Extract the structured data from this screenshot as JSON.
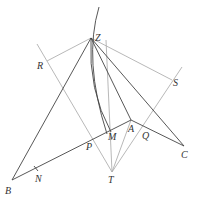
{
  "diagram": {
    "type": "geometry-construction",
    "colors": {
      "background": "#ffffff",
      "primary_line": "#444444",
      "construction_line": "#b0b0b0",
      "label": "#333333"
    },
    "points": {
      "Z": {
        "label": "Z",
        "x": 91,
        "y": 38,
        "lx": 95,
        "ly": 40
      },
      "R": {
        "label": "R",
        "x": 47,
        "y": 60,
        "lx": 37,
        "ly": 69
      },
      "S": {
        "label": "S",
        "x": 170,
        "y": 82,
        "lx": 173,
        "ly": 86
      },
      "B": {
        "label": "B",
        "x": 12,
        "y": 180,
        "lx": 5,
        "ly": 195
      },
      "N": {
        "label": "N",
        "x": 36,
        "y": 169,
        "lx": 35,
        "ly": 182
      },
      "P": {
        "label": "P",
        "x": 91,
        "y": 141,
        "lx": 86,
        "ly": 151
      },
      "M": {
        "label": "M",
        "x": 111,
        "y": 132,
        "lx": 109,
        "ly": 140
      },
      "A": {
        "label": "A",
        "x": 131,
        "y": 120,
        "lx": 128,
        "ly": 132
      },
      "Q": {
        "label": "Q",
        "x": 146,
        "y": 128,
        "lx": 142,
        "ly": 140
      },
      "C": {
        "label": "C",
        "x": 184,
        "y": 146,
        "lx": 181,
        "ly": 158
      },
      "T": {
        "label": "T",
        "x": 112,
        "y": 172,
        "lx": 108,
        "ly": 183
      }
    },
    "labels": [
      "Z",
      "R",
      "S",
      "B",
      "N",
      "P",
      "M",
      "A",
      "Q",
      "C",
      "T"
    ]
  }
}
